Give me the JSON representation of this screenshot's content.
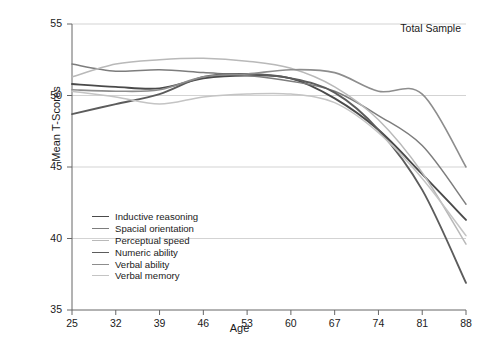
{
  "chart_data": {
    "type": "line",
    "title": "",
    "annotation": "Total Sample",
    "xlabel": "Age",
    "ylabel": "Mean T-Scores",
    "x": [
      25,
      32,
      39,
      46,
      53,
      60,
      67,
      74,
      81,
      88
    ],
    "xtick_labels": [
      "25",
      "32",
      "39",
      "46",
      "53",
      "60",
      "67",
      "74",
      "81",
      "88"
    ],
    "ytick_labels": [
      "35",
      "40",
      "45",
      "50",
      "55"
    ],
    "yticks": [
      35,
      40,
      45,
      50,
      55
    ],
    "xlim": [
      25,
      88
    ],
    "ylim": [
      35,
      55
    ],
    "grid": "horizontal",
    "legend_position": "bottom-left-inside",
    "series": [
      {
        "name": "Inductive reasoning",
        "color": "#4a4a4a",
        "width": 1.9,
        "values": [
          50.8,
          50.6,
          50.5,
          51.2,
          51.4,
          51.2,
          49.8,
          47.6,
          44.5,
          41.3
        ]
      },
      {
        "name": "Spacial orientation",
        "color": "#7d7d7d",
        "width": 1.5,
        "values": [
          52.2,
          51.7,
          51.8,
          51.6,
          51.4,
          51.0,
          50.3,
          48.6,
          46.5,
          42.4
        ]
      },
      {
        "name": "Perceptual speed",
        "color": "#b9b9b9",
        "width": 1.5,
        "values": [
          51.3,
          52.2,
          52.5,
          52.6,
          52.4,
          51.9,
          50.6,
          48.3,
          44.6,
          39.6
        ]
      },
      {
        "name": "Numeric ability",
        "color": "#5c5c5c",
        "width": 1.9,
        "values": [
          48.7,
          49.4,
          50.1,
          51.3,
          51.5,
          51.2,
          50.2,
          47.6,
          43.4,
          36.9
        ]
      },
      {
        "name": "Verbal ability",
        "color": "#8d8d8d",
        "width": 1.6,
        "values": [
          50.4,
          50.3,
          50.4,
          51.3,
          51.5,
          51.8,
          51.6,
          50.3,
          50.1,
          45.0
        ]
      },
      {
        "name": "Verbal memory",
        "color": "#c4c4c4",
        "width": 1.5,
        "values": [
          50.3,
          49.9,
          49.4,
          49.9,
          50.1,
          50.1,
          49.5,
          47.4,
          44.2,
          40.2
        ]
      }
    ]
  }
}
